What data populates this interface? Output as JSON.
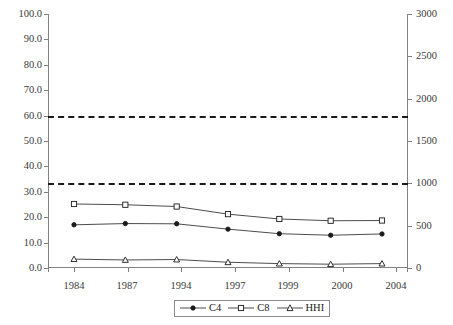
{
  "chart_data": {
    "type": "line",
    "title": "",
    "subtitle": "",
    "xlabel": "",
    "ylabel": "",
    "ylabel_right": "",
    "categories": [
      "1984",
      "1987",
      "1994",
      "1997",
      "1999",
      "2000",
      "2004"
    ],
    "grid": false,
    "legend_position": "bottom-center",
    "axes": {
      "left": {
        "min": 0.0,
        "max": 100.0,
        "step": 10.0,
        "ticks": [
          "0.0",
          "10.0",
          "20.0",
          "30.0",
          "40.0",
          "50.0",
          "60.0",
          "70.0",
          "80.0",
          "90.0",
          "100.0"
        ],
        "tick_values": [
          0,
          10,
          20,
          30,
          40,
          50,
          60,
          70,
          80,
          90,
          100
        ]
      },
      "right": {
        "min": 0,
        "max": 3000,
        "step": 500,
        "ticks": [
          "0",
          "500",
          "1000",
          "1500",
          "2000",
          "2500",
          "3000"
        ],
        "tick_values": [
          0,
          500,
          1000,
          1500,
          2000,
          2500,
          3000
        ]
      }
    },
    "series": [
      {
        "name": "C4",
        "axis": "left",
        "marker": "filled-circle",
        "line_style": "solid",
        "color": "#4d4d4d",
        "values": [
          17.0,
          17.5,
          17.4,
          15.3,
          13.5,
          12.9,
          13.4
        ]
      },
      {
        "name": "C8",
        "axis": "left",
        "marker": "open-square",
        "line_style": "solid",
        "color": "#4d4d4d",
        "values": [
          25.2,
          24.9,
          24.2,
          21.2,
          19.3,
          18.6,
          18.7
        ]
      },
      {
        "name": "HHI",
        "axis": "right",
        "marker": "open-triangle",
        "line_style": "solid",
        "color": "#4d4d4d",
        "values": [
          105,
          95,
          100,
          68,
          52,
          45,
          52
        ]
      }
    ],
    "reference_lines": [
      {
        "name": "highly-concentrated-threshold",
        "axis": "right",
        "value": 1800,
        "left_axis_equivalent": 61.5,
        "style": "dashed",
        "color": "#1a1a1a"
      },
      {
        "name": "moderately-concentrated-threshold",
        "axis": "right",
        "value": 1000,
        "left_axis_equivalent": 33.3,
        "style": "dashed",
        "color": "#1a1a1a"
      }
    ],
    "legend": [
      {
        "label": "C4",
        "marker": "filled-circle"
      },
      {
        "label": "C8",
        "marker": "open-square"
      },
      {
        "label": "HHI",
        "marker": "open-triangle"
      }
    ]
  }
}
